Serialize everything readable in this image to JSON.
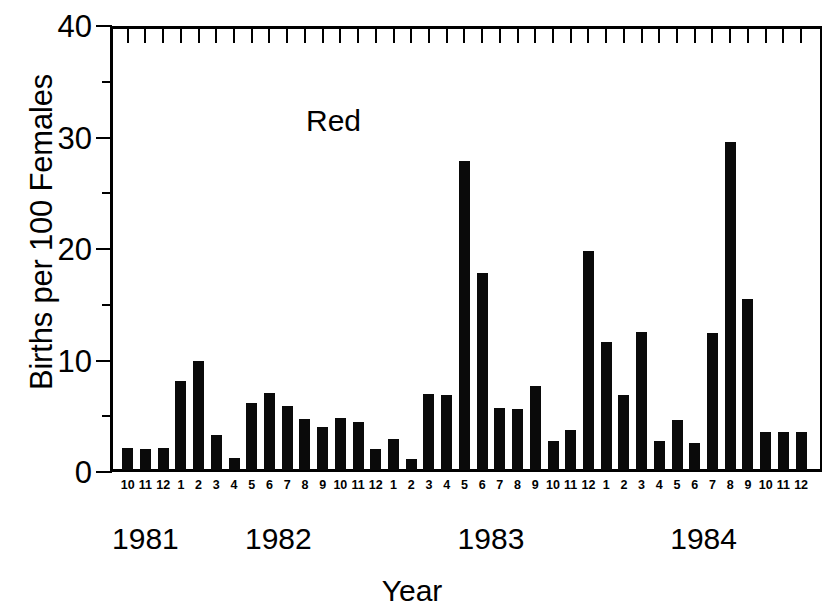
{
  "chart_data": {
    "type": "bar",
    "title": "",
    "annotation": "Red",
    "xlabel": "Year",
    "ylabel": "Births per 100 Females",
    "ylim": [
      0,
      40
    ],
    "ytick_labels": [
      "0",
      "10",
      "20",
      "30",
      "40"
    ],
    "ytick_values": [
      0,
      10,
      20,
      30,
      40
    ],
    "yminor_values": [
      5,
      15,
      25,
      35
    ],
    "grid": false,
    "legend": "none",
    "bar_color": "#0a0a0a",
    "categories": [
      "10",
      "11",
      "12",
      "1",
      "2",
      "3",
      "4",
      "5",
      "6",
      "7",
      "8",
      "9",
      "10",
      "11",
      "12",
      "1",
      "2",
      "3",
      "4",
      "5",
      "6",
      "7",
      "8",
      "9",
      "10",
      "11",
      "12",
      "1",
      "2",
      "3",
      "4",
      "5",
      "6",
      "7",
      "8",
      "9",
      "10",
      "11",
      "12"
    ],
    "years": [
      {
        "label": "1981",
        "start_index": 0,
        "count": 3
      },
      {
        "label": "1982",
        "start_index": 3,
        "count": 12
      },
      {
        "label": "1983",
        "start_index": 15,
        "count": 12
      },
      {
        "label": "1984",
        "start_index": 27,
        "count": 12
      }
    ],
    "values": [
      2.0,
      1.9,
      2.0,
      8.0,
      9.8,
      3.1,
      1.1,
      6.0,
      6.9,
      5.7,
      4.6,
      3.9,
      4.7,
      4.3,
      1.9,
      2.8,
      1.0,
      6.8,
      6.7,
      27.7,
      17.7,
      5.6,
      5.5,
      7.5,
      2.6,
      3.6,
      19.6,
      11.5,
      6.7,
      12.4,
      2.6,
      4.5,
      2.4,
      12.3,
      29.4,
      15.3,
      3.4,
      3.4,
      3.4
    ]
  }
}
